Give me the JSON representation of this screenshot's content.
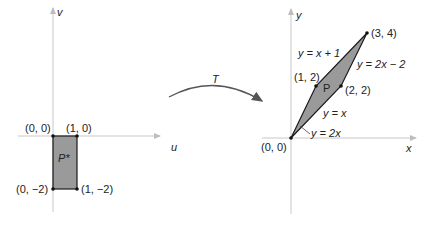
{
  "left_plot": {
    "axis_vertical_label": "v",
    "axis_horizontal_label": "u",
    "region_label": "P*",
    "points": [
      {
        "label": "(0, 0)"
      },
      {
        "label": "(1, 0)"
      },
      {
        "label": "(0, −2)"
      },
      {
        "label": "(1, −2)"
      }
    ]
  },
  "transform": {
    "label": "T"
  },
  "right_plot": {
    "axis_vertical_label": "y",
    "axis_horizontal_label": "x",
    "region_label": "P",
    "points": [
      {
        "label": "(0, 0)"
      },
      {
        "label": "(1, 2)"
      },
      {
        "label": "(2, 2)"
      },
      {
        "label": "(3, 4)"
      }
    ],
    "lines": [
      {
        "label": "y = x + 1"
      },
      {
        "label": "y = 2x − 2"
      },
      {
        "label": "y = x"
      },
      {
        "label": "y = 2x"
      }
    ]
  },
  "colors": {
    "region_fill": "#9a9a9a",
    "axis": "#c8c8c8",
    "outline": "#1a1a1a"
  }
}
